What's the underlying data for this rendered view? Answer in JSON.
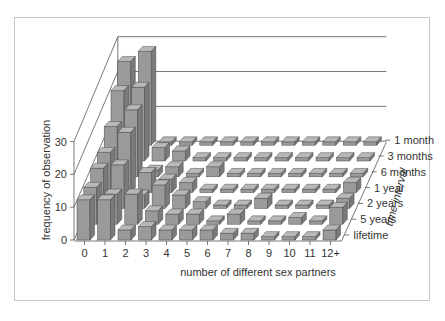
{
  "chart_data": {
    "type": "bar3d",
    "title": "",
    "xlabel": "number of different sex partners",
    "ylabel": "frequency of observation",
    "zlabel": "time interval",
    "ylim": [
      0,
      30
    ],
    "yticks": [
      0,
      10,
      20,
      30
    ],
    "categories": [
      "0",
      "1",
      "2",
      "3",
      "4",
      "5",
      "6",
      "7",
      "8",
      "9",
      "10",
      "11",
      "12+"
    ],
    "series": [
      {
        "name": "lifetime",
        "values": [
          12,
          12,
          3,
          4,
          3,
          3,
          3,
          2,
          2,
          1,
          1,
          1,
          3
        ]
      },
      {
        "name": "5 years",
        "values": [
          11,
          9,
          9,
          4,
          3,
          3,
          1,
          3,
          1,
          1,
          2,
          1,
          5
        ]
      },
      {
        "name": "2 years",
        "values": [
          12,
          13,
          4,
          7,
          4,
          2,
          1,
          1,
          3,
          1,
          1,
          1,
          3
        ]
      },
      {
        "name": "1 year",
        "values": [
          12,
          18,
          6,
          4,
          3,
          1,
          1,
          1,
          1,
          1,
          1,
          1,
          3
        ]
      },
      {
        "name": "6 months",
        "values": [
          15,
          20,
          2,
          3,
          1,
          3,
          1,
          1,
          1,
          1,
          1,
          1,
          1
        ]
      },
      {
        "name": "3 months",
        "values": [
          21,
          22,
          4,
          3,
          1,
          1,
          1,
          1,
          1,
          1,
          1,
          1,
          1
        ]
      },
      {
        "name": "1 month",
        "values": [
          25,
          28,
          1,
          1,
          1,
          1,
          1,
          1,
          1,
          1,
          1,
          1,
          1
        ]
      }
    ],
    "legend_position": "right (depth axis labels)",
    "grid": true
  },
  "colors": {
    "bar_front": "#9a9a9a",
    "bar_top": "#b8b8b8",
    "bar_side": "#7a7a7a",
    "bar_edge": "#4a4a4a",
    "axis": "#555555",
    "text": "#333333",
    "frame": "#c8c8c8"
  }
}
